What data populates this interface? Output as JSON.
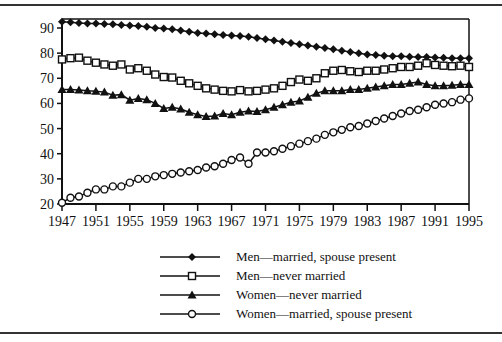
{
  "chart_data": {
    "type": "line",
    "title": "",
    "xlabel": "",
    "ylabel": "",
    "xlim": [
      1947,
      1995
    ],
    "ylim": [
      20,
      90
    ],
    "grid": false,
    "legend_position": "bottom-center",
    "x_ticks": [
      "1947",
      "1951",
      "1955",
      "1959",
      "1963",
      "1967",
      "1971",
      "1975",
      "1979",
      "1983",
      "1987",
      "1991",
      "1995"
    ],
    "y_ticks": [
      "20",
      "30",
      "40",
      "50",
      "60",
      "70",
      "80",
      "90"
    ],
    "x": [
      1947,
      1948,
      1949,
      1950,
      1951,
      1952,
      1953,
      1954,
      1955,
      1956,
      1957,
      1958,
      1959,
      1960,
      1961,
      1962,
      1963,
      1964,
      1965,
      1966,
      1967,
      1968,
      1969,
      1970,
      1971,
      1972,
      1973,
      1974,
      1975,
      1976,
      1977,
      1978,
      1979,
      1980,
      1981,
      1982,
      1983,
      1984,
      1985,
      1986,
      1987,
      1988,
      1989,
      1990,
      1991,
      1992,
      1993,
      1994,
      1995
    ],
    "series": [
      {
        "name": "Men—married, spouse present",
        "marker": "filled-diamond",
        "values": [
          92.5,
          92.3,
          92.0,
          91.8,
          91.8,
          91.6,
          91.5,
          91.2,
          91.0,
          90.8,
          90.5,
          90.0,
          89.8,
          89.5,
          89.0,
          88.5,
          88.0,
          87.8,
          87.5,
          87.2,
          87.0,
          86.8,
          86.5,
          86.0,
          85.5,
          85.0,
          84.5,
          84.0,
          83.5,
          83.0,
          82.5,
          82.0,
          81.5,
          81.0,
          80.5,
          80.0,
          79.5,
          79.3,
          79.0,
          78.8,
          78.8,
          78.6,
          78.5,
          78.5,
          78.3,
          78.2,
          78.0,
          78.0,
          78.0
        ]
      },
      {
        "name": "Men—never married",
        "marker": "open-square",
        "values": [
          77.5,
          78.0,
          78.2,
          77.0,
          76.2,
          75.5,
          75.0,
          75.5,
          73.5,
          74.0,
          73.0,
          71.5,
          70.5,
          70.3,
          69.0,
          68.0,
          67.0,
          66.0,
          65.5,
          65.0,
          64.8,
          65.3,
          64.8,
          65.0,
          65.5,
          66.0,
          67.0,
          68.5,
          69.5,
          69.0,
          70.0,
          72.0,
          73.0,
          73.3,
          72.8,
          72.5,
          73.0,
          73.0,
          73.5,
          74.0,
          74.5,
          74.5,
          75.0,
          76.0,
          75.3,
          75.0,
          74.8,
          75.0,
          74.5
        ]
      },
      {
        "name": "Women—never married",
        "marker": "filled-triangle",
        "values": [
          65.5,
          65.5,
          65.3,
          65.0,
          64.8,
          64.5,
          63.3,
          63.5,
          61.3,
          62.0,
          61.5,
          60.0,
          58.0,
          58.5,
          57.8,
          56.5,
          55.5,
          54.8,
          55.0,
          56.0,
          55.5,
          56.5,
          57.0,
          56.8,
          57.5,
          58.5,
          59.5,
          60.5,
          61.0,
          62.5,
          64.0,
          65.0,
          65.0,
          65.0,
          65.5,
          65.5,
          66.0,
          66.5,
          67.0,
          67.5,
          67.5,
          68.0,
          68.5,
          67.5,
          67.0,
          67.0,
          67.2,
          67.5,
          67.5
        ]
      },
      {
        "name": "Women—married, spouse present",
        "marker": "open-circle",
        "values": [
          20.5,
          22.5,
          23.0,
          24.5,
          25.8,
          25.8,
          27.0,
          27.0,
          28.5,
          30.0,
          30.0,
          31.0,
          31.5,
          32.0,
          32.5,
          33.0,
          33.5,
          34.5,
          35.0,
          36.0,
          37.5,
          38.5,
          36.0,
          40.5,
          40.5,
          41.0,
          42.0,
          43.0,
          44.0,
          45.0,
          46.0,
          47.5,
          48.5,
          49.5,
          50.5,
          51.0,
          52.0,
          53.0,
          54.0,
          55.0,
          56.0,
          57.0,
          57.5,
          58.5,
          59.5,
          60.0,
          60.5,
          61.5,
          62.0
        ]
      }
    ]
  },
  "colors": {
    "ink": "#111111",
    "rule": "#333333",
    "background": "#ffffff"
  }
}
